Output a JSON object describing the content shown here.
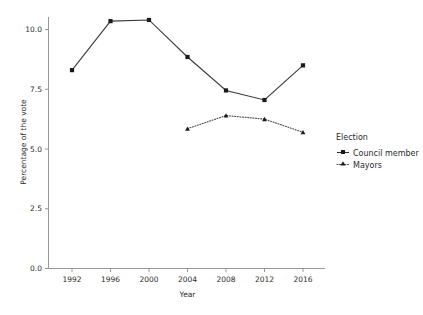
{
  "chart_data": {
    "type": "line",
    "title": "",
    "xlabel": "Year",
    "ylabel": "Percentage of the vote",
    "x": [
      1992,
      1996,
      2000,
      2004,
      2008,
      2012,
      2016
    ],
    "xticklabels": [
      "1992",
      "1996",
      "2000",
      "2004",
      "2008",
      "2012",
      "2016"
    ],
    "yticklabels": [
      "0.0",
      "2.5",
      "5.0",
      "7.5",
      "10.0"
    ],
    "yticks": [
      0.0,
      2.5,
      5.0,
      7.5,
      10.0
    ],
    "ylim": [
      0.0,
      10.9
    ],
    "xlim": [
      1990.2,
      2017.8
    ],
    "grid": false,
    "legend_position": "right",
    "legend_title": "Election",
    "series": [
      {
        "name": "Council member",
        "linestyle": "solid",
        "marker": "square",
        "color": "#333333",
        "x": [
          1992,
          1996,
          2000,
          2004,
          2008,
          2012,
          2016
        ],
        "values": [
          8.3,
          10.35,
          10.4,
          8.85,
          7.45,
          7.05,
          8.5
        ]
      },
      {
        "name": "Mayors",
        "linestyle": "dotted",
        "marker": "triangle",
        "color": "#4a4a4a",
        "x": [
          2004,
          2008,
          2012,
          2016
        ],
        "values": [
          5.85,
          6.4,
          6.25,
          5.7
        ]
      }
    ]
  },
  "legend": {
    "title": "Election",
    "entries": [
      {
        "label": "Council member",
        "marker": "square",
        "linestyle": "solid"
      },
      {
        "label": "Mayors",
        "marker": "triangle",
        "linestyle": "dotted"
      }
    ]
  },
  "axes": {
    "x_title": "Year",
    "y_title": "Percentage of the vote"
  },
  "colors": {
    "background": "#ffffff",
    "axis": "#8c8c8c",
    "text": "#2b2b2b",
    "series_council": "#333333",
    "series_mayors": "#4a4a4a"
  }
}
